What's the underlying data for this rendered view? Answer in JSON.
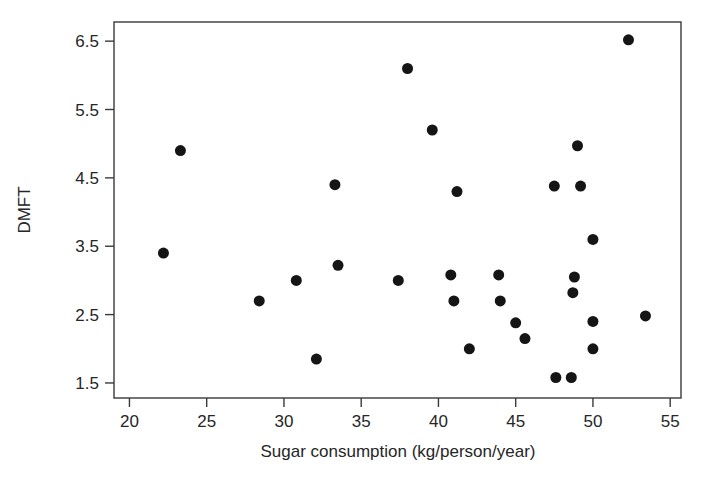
{
  "chart_data": {
    "type": "scatter",
    "title": "",
    "xlabel": "Sugar consumption (kg/person/year)",
    "ylabel": "DMFT",
    "xlim": [
      19.0,
      55.7
    ],
    "ylim": [
      1.28,
      6.78
    ],
    "xticks": [
      20,
      25,
      30,
      35,
      40,
      45,
      50,
      55
    ],
    "yticks": [
      1.5,
      2.5,
      3.5,
      4.5,
      5.5,
      6.5
    ],
    "xticklabels": [
      "20",
      "25",
      "30",
      "35",
      "40",
      "45",
      "50",
      "55"
    ],
    "yticklabels": [
      "1.5",
      "2.5",
      "3.5",
      "4.5",
      "5.5",
      "6.5"
    ],
    "grid": false,
    "legend": false,
    "marker": "filled-circle",
    "marker_color": "#151515",
    "marker_size_px": 11,
    "frame_color": "#3a3a3a",
    "background": "#ffffff",
    "n_points": 29,
    "points": [
      {
        "x": 22.2,
        "y": 3.4
      },
      {
        "x": 23.3,
        "y": 4.9
      },
      {
        "x": 28.4,
        "y": 2.7
      },
      {
        "x": 30.8,
        "y": 3.0
      },
      {
        "x": 32.1,
        "y": 1.85
      },
      {
        "x": 33.3,
        "y": 4.4
      },
      {
        "x": 33.5,
        "y": 3.22
      },
      {
        "x": 37.4,
        "y": 3.0
      },
      {
        "x": 38.0,
        "y": 6.1
      },
      {
        "x": 39.6,
        "y": 5.2
      },
      {
        "x": 40.8,
        "y": 3.08
      },
      {
        "x": 41.0,
        "y": 2.7
      },
      {
        "x": 41.2,
        "y": 4.3
      },
      {
        "x": 42.0,
        "y": 2.0
      },
      {
        "x": 43.9,
        "y": 3.08
      },
      {
        "x": 44.0,
        "y": 2.7
      },
      {
        "x": 45.0,
        "y": 2.38
      },
      {
        "x": 45.6,
        "y": 2.15
      },
      {
        "x": 47.5,
        "y": 4.38
      },
      {
        "x": 47.6,
        "y": 1.58
      },
      {
        "x": 48.6,
        "y": 1.58
      },
      {
        "x": 48.7,
        "y": 2.82
      },
      {
        "x": 48.8,
        "y": 3.05
      },
      {
        "x": 49.0,
        "y": 4.97
      },
      {
        "x": 49.2,
        "y": 4.38
      },
      {
        "x": 50.0,
        "y": 3.6
      },
      {
        "x": 50.0,
        "y": 2.4
      },
      {
        "x": 50.0,
        "y": 2.0
      },
      {
        "x": 52.3,
        "y": 6.52
      },
      {
        "x": 53.4,
        "y": 2.48
      }
    ]
  }
}
